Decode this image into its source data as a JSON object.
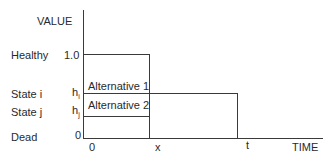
{
  "axes": {
    "y_title": "VALUE",
    "x_title": "TIME",
    "y_ticks": {
      "healthy": "1.0",
      "state_i": "h",
      "state_i_sub": "i",
      "state_j": "h",
      "state_j_sub": "j",
      "dead": "0"
    },
    "x_ticks": {
      "origin": "0",
      "x": "x",
      "t": "t"
    }
  },
  "states": {
    "healthy": "Healthy",
    "state_i": "State i",
    "state_j": "State j",
    "dead": "Dead"
  },
  "alternatives": {
    "alt1": "Alternative 1",
    "alt2": "Alternative 2"
  },
  "colors": {
    "line": "#3a3a3a",
    "text": "#2a2a2a",
    "background": "#ffffff"
  }
}
